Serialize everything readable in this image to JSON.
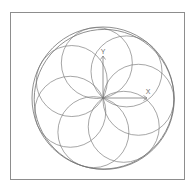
{
  "figure": {
    "frame": {
      "border_color": "#8d8d8d",
      "background": "#ffffff",
      "x": 10,
      "y": 12,
      "width": 175,
      "height": 168
    },
    "axes": {
      "x_label": "X",
      "y_label": "Y",
      "origin_x": 102,
      "origin_y": 97,
      "x_axis_length": 44,
      "y_axis_length": 42,
      "stroke_color": "#7a7a7a"
    },
    "caption": {
      "left_text": "",
      "right_text": ""
    }
  },
  "chart_data": {
    "type": "scatter",
    "title": "",
    "subtitle": "",
    "xlabel": "X",
    "ylabel": "Y",
    "legend_position": "none",
    "grid": false,
    "geometry": {
      "center_x": 102,
      "center_y": 97,
      "outer_radius": 71,
      "outer_circles": [
        {
          "cx": 102,
          "cy": 97,
          "r": 71
        },
        {
          "cx": 103.2,
          "cy": 98.4,
          "r": 70
        }
      ],
      "petal_count": 7,
      "inner_circle_radius": 35.5,
      "start_angle_deg": -100,
      "inner_circles": [
        {
          "index": 0,
          "angle_deg": -100,
          "cx": 95.83,
          "cy": 62.04,
          "r": 35.5
        },
        {
          "index": 1,
          "angle_deg": -48.57,
          "cx": 125.5,
          "cy": 70.38,
          "r": 35.5
        },
        {
          "index": 2,
          "angle_deg": 2.86,
          "cx": 137.46,
          "cy": 98.77,
          "r": 35.5
        },
        {
          "index": 3,
          "angle_deg": 54.29,
          "cx": 122.74,
          "cy": 125.82,
          "r": 35.5
        },
        {
          "index": 4,
          "angle_deg": 105.71,
          "cx": 92.39,
          "cy": 131.16,
          "r": 35.5
        },
        {
          "index": 5,
          "angle_deg": 157.14,
          "cx": 69.29,
          "cy": 110.78,
          "r": 35.5
        },
        {
          "index": 6,
          "angle_deg": 208.57,
          "cx": 70.79,
          "cy": 80.04,
          "r": 35.5
        }
      ],
      "stroke_color": "#6b6b6b",
      "stroke_width": 0.7
    },
    "axis_ranges": {
      "xlim": [
        -71,
        71
      ],
      "ylim": [
        -71,
        71
      ]
    }
  }
}
